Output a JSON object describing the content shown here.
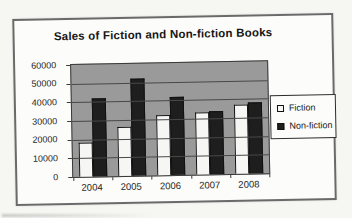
{
  "chart_data": {
    "type": "bar",
    "title": "Sales of Fiction and Non-fiction Books",
    "categories": [
      "2004",
      "2005",
      "2006",
      "2007",
      "2008"
    ],
    "series": [
      {
        "name": "Fiction",
        "color": "#f6f6f4",
        "values": [
          18000,
          26000,
          32000,
          33000,
          37000
        ]
      },
      {
        "name": "Non-fiction",
        "color": "#1e1e1e",
        "values": [
          42000,
          52000,
          42000,
          34000,
          38000
        ]
      }
    ],
    "ylim": [
      0,
      60000
    ],
    "yticks": [
      0,
      10000,
      20000,
      30000,
      40000,
      50000,
      60000
    ],
    "xlabel": "",
    "ylabel": "",
    "grid": true,
    "legend_position": "right"
  },
  "colors": {
    "plot_background": "#9a9a9a",
    "gridline": "#484848",
    "figure_background": "#fcfcfa",
    "page_background": "#f6f6f3",
    "fiction_fill": "#f6f6f4",
    "nonfiction_fill": "#1e1e1e"
  }
}
